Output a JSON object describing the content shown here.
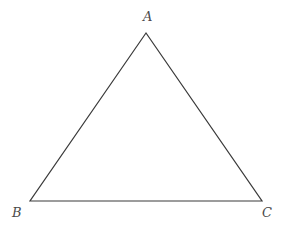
{
  "figure": {
    "kind": "geometry-diagram",
    "shape": "triangle",
    "background_color": "#ffffff",
    "stroke_color": "#3a3a3a",
    "stroke_width": 1.2,
    "label_color": "#4a4a4a",
    "canvas": {
      "width": 285,
      "height": 231
    },
    "vertices": [
      {
        "id": "A",
        "label": "A",
        "x": 146,
        "y": 33,
        "label_x": 148,
        "label_y": 17
      },
      {
        "id": "B",
        "label": "B",
        "x": 30,
        "y": 201,
        "label_x": 17,
        "label_y": 213
      },
      {
        "id": "C",
        "label": "C",
        "x": 262,
        "y": 201,
        "label_x": 267,
        "label_y": 213
      }
    ],
    "edges": [
      {
        "id": "AB",
        "from": "A",
        "to": "B"
      },
      {
        "id": "AC",
        "from": "A",
        "to": "C"
      },
      {
        "id": "BC",
        "from": "B",
        "to": "C"
      }
    ],
    "path": "M 146 33 L 30 201 L 262 201 Z"
  }
}
